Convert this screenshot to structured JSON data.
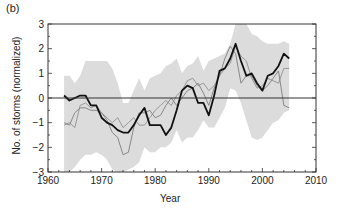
{
  "chart_data": {
    "type": "line",
    "panel_label": "(b)",
    "title": "",
    "xlabel": "Year",
    "ylabel": "No. of storms (normalized)",
    "xlim": [
      1960,
      2010
    ],
    "ylim": [
      -3,
      3
    ],
    "xticks": [
      1960,
      1970,
      1980,
      1990,
      2000,
      2010
    ],
    "yticks": [
      -3,
      -2,
      -1,
      0,
      1,
      2,
      3
    ],
    "grid": false,
    "legend": null,
    "reference_line": 0,
    "x": [
      1963,
      1964,
      1965,
      1966,
      1967,
      1968,
      1969,
      1970,
      1971,
      1972,
      1973,
      1974,
      1975,
      1976,
      1977,
      1978,
      1979,
      1980,
      1981,
      1982,
      1983,
      1984,
      1985,
      1986,
      1987,
      1988,
      1989,
      1990,
      1991,
      1992,
      1993,
      1994,
      1995,
      1996,
      1997,
      1998,
      1999,
      2000,
      2001,
      2002,
      2003,
      2004,
      2005
    ],
    "series": [
      {
        "name": "observed (black)",
        "color": "#111111",
        "width": 1.8,
        "values": [
          0.1,
          -0.1,
          0.0,
          0.1,
          0.1,
          -0.3,
          -0.3,
          -0.8,
          -1.0,
          -1.1,
          -1.3,
          -1.4,
          -1.4,
          -1.1,
          -0.7,
          -0.4,
          -1.1,
          -1.1,
          -1.1,
          -1.5,
          -1.2,
          -0.5,
          0.3,
          0.5,
          0.4,
          -0.2,
          -0.2,
          -0.7,
          0.1,
          1.1,
          1.2,
          1.6,
          2.2,
          1.5,
          0.9,
          1.0,
          0.6,
          0.3,
          0.9,
          1.0,
          1.3,
          1.8,
          1.6
        ]
      },
      {
        "name": "model 1 (gray)",
        "color": "#888888",
        "width": 1.0,
        "values": [
          -1.0,
          -1.1,
          -0.6,
          -0.4,
          -0.4,
          -0.5,
          -0.5,
          -0.6,
          -0.9,
          -1.4,
          -1.6,
          -2.3,
          -2.2,
          -1.2,
          -0.6,
          -0.6,
          -0.5,
          -0.8,
          -0.7,
          -0.3,
          0.0,
          -0.3,
          0.0,
          0.3,
          0.4,
          0.6,
          0.2,
          -0.3,
          0.4,
          0.9,
          1.6,
          2.1,
          1.8,
          0.6,
          0.9,
          0.9,
          0.5,
          0.3,
          0.5,
          0.8,
          1.1,
          -0.3,
          -0.4
        ]
      },
      {
        "name": "model 2 (gray)",
        "color": "#999999",
        "width": 1.0,
        "values": [
          -1.1,
          -1.0,
          -1.2,
          -0.3,
          -0.2,
          -0.4,
          -0.3,
          -0.6,
          -0.8,
          -1.0,
          -0.8,
          -1.2,
          -1.0,
          -0.8,
          -1.1,
          -1.1,
          -0.8,
          -0.5,
          -0.3,
          -0.1,
          -0.3,
          0.1,
          0.3,
          0.7,
          0.8,
          0.5,
          0.6,
          0.3,
          0.5,
          0.9,
          1.2,
          1.4,
          2.1,
          1.7,
          1.5,
          0.8,
          0.4,
          0.5,
          0.8,
          0.7,
          0.6,
          1.2,
          1.2
        ]
      }
    ],
    "uncertainty_band": {
      "color": "#dcdcdc",
      "upper": [
        0.9,
        0.9,
        0.6,
        0.9,
        1.5,
        1.5,
        1.5,
        1.5,
        1.5,
        1.2,
        0.6,
        -0.2,
        -0.2,
        0.3,
        0.8,
        0.3,
        0.8,
        0.9,
        1.0,
        1.3,
        1.4,
        1.6,
        1.0,
        1.3,
        1.4,
        1.7,
        1.1,
        1.5,
        1.6,
        1.7,
        1.8,
        2.2,
        3.0,
        3.0,
        3.0,
        2.6,
        2.5,
        2.3,
        2.2,
        2.2,
        2.2,
        2.3,
        2.2
      ],
      "lower": [
        -3.0,
        -3.0,
        -2.8,
        -2.5,
        -2.3,
        -2.3,
        -2.2,
        -2.3,
        -2.5,
        -2.9,
        -3.0,
        -3.0,
        -2.9,
        -2.8,
        -2.6,
        -2.0,
        -2.2,
        -2.2,
        -2.0,
        -2.0,
        -1.8,
        -1.3,
        -1.8,
        -1.6,
        -1.6,
        -1.3,
        -0.9,
        -1.2,
        -1.2,
        -0.8,
        -0.4,
        0.4,
        0.3,
        -0.2,
        -0.9,
        -1.6,
        -1.7,
        -1.6,
        -1.3,
        -1.0,
        -0.9,
        -0.6,
        -0.5
      ]
    }
  }
}
